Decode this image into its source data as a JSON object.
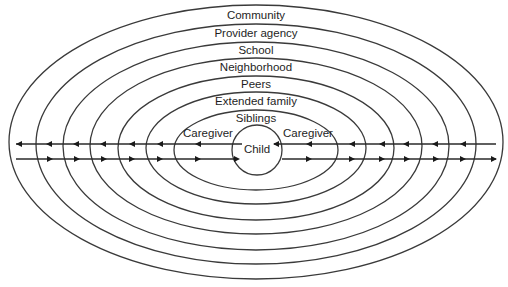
{
  "diagram": {
    "type": "nested-ecological-model",
    "center": {
      "x": 256,
      "y": 142
    },
    "layers": [
      {
        "label": "Community",
        "rx": 247,
        "ry": 137,
        "label_y": 16
      },
      {
        "label": "Provider agency",
        "rx": 220,
        "ry": 120,
        "label_y": 34
      },
      {
        "label": "School",
        "rx": 193,
        "ry": 104,
        "label_y": 51
      },
      {
        "label": "Neighborhood",
        "rx": 166,
        "ry": 88,
        "label_y": 68
      },
      {
        "label": "Peers",
        "rx": 138,
        "ry": 72,
        "label_y": 85
      },
      {
        "label": "Extended family",
        "rx": 110,
        "ry": 56,
        "label_y": 102
      },
      {
        "label": "Siblings",
        "rx": 82,
        "ry": 40,
        "label_y": 119
      }
    ],
    "caregiver_left": {
      "label": "Caregiver",
      "x": 208,
      "y": 134
    },
    "caregiver_right": {
      "label": "Caregiver",
      "x": 308,
      "y": 134
    },
    "child": {
      "label": "Child",
      "cx": 257,
      "cy": 150,
      "r": 25,
      "label_y": 149
    },
    "flows": {
      "inward_line_y": 144,
      "outward_line_y": 159,
      "direction_top": "toward-outer",
      "direction_bottom": "toward-child"
    }
  }
}
